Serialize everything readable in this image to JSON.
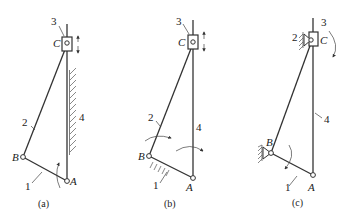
{
  "figure": {
    "panels": [
      {
        "id": "a",
        "caption": "(a)",
        "labels": {
          "slider_num": "3",
          "C": "C",
          "link2": "2",
          "link4": "4",
          "B": "B",
          "link1": "1",
          "A": "A"
        }
      },
      {
        "id": "b",
        "caption": "(b)",
        "labels": {
          "slider_num": "3",
          "C": "C",
          "link2": "2",
          "link4": "4",
          "B": "B",
          "link1": "1",
          "A": "A"
        }
      },
      {
        "id": "c",
        "caption": "(c)",
        "labels": {
          "slider_num": "3",
          "C": "C",
          "link2": "2",
          "link4": "4",
          "B": "B",
          "link1": "1",
          "A": "A"
        }
      }
    ]
  },
  "colors": {
    "line": "#333333",
    "background": "#ffffff"
  }
}
